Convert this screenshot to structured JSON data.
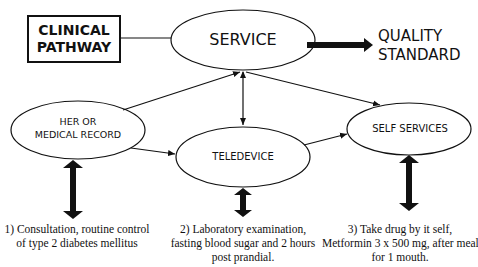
{
  "diagram": {
    "title_box": {
      "line1": "CLINICAL",
      "line2": "PATHWAY"
    },
    "nodes": {
      "service": {
        "label": "SERVICE"
      },
      "quality": {
        "line1": "QUALITY",
        "line2": "STANDARD"
      },
      "her": {
        "line1": "HER OR",
        "line2": "MEDICAL RECORD"
      },
      "teledevice": {
        "label": "TELEDEVICE"
      },
      "self_services": {
        "label": "SELF SERVICES"
      }
    },
    "captions": [
      {
        "line1": "1) Consultation, routine control",
        "line2": "of type 2 diabetes mellitus"
      },
      {
        "line1": "2) Laboratory examination,",
        "line2": "fasting blood sugar and 2 hours",
        "line3": "post prandial."
      },
      {
        "line1": "3) Take drug by it self,",
        "line2": "Metformin 3 x 500 mg, after meal",
        "line3": "for 1 mouth."
      }
    ],
    "edges": [
      {
        "from": "CLINICAL PATHWAY",
        "to": "SERVICE",
        "type": "line"
      },
      {
        "from": "SERVICE",
        "to": "QUALITY STANDARD",
        "type": "thick-arrow"
      },
      {
        "from": "HER OR MEDICAL RECORD",
        "to": "SERVICE",
        "type": "arrow"
      },
      {
        "from": "HER OR MEDICAL RECORD",
        "to": "TELEDEVICE",
        "type": "arrow"
      },
      {
        "from": "SERVICE",
        "to": "TELEDEVICE",
        "type": "double-arrow"
      },
      {
        "from": "SERVICE",
        "to": "SELF SERVICES",
        "type": "double-arrow"
      },
      {
        "from": "TELEDEVICE",
        "to": "SELF SERVICES",
        "type": "arrow"
      },
      {
        "from": "HER OR MEDICAL RECORD",
        "to": "caption 1",
        "type": "thick-double-arrow"
      },
      {
        "from": "TELEDEVICE",
        "to": "caption 2",
        "type": "thick-double-arrow"
      },
      {
        "from": "SELF SERVICES",
        "to": "caption 3",
        "type": "thick-double-arrow"
      }
    ],
    "colors": {
      "stroke": "#111111",
      "background": "#ffffff"
    }
  }
}
